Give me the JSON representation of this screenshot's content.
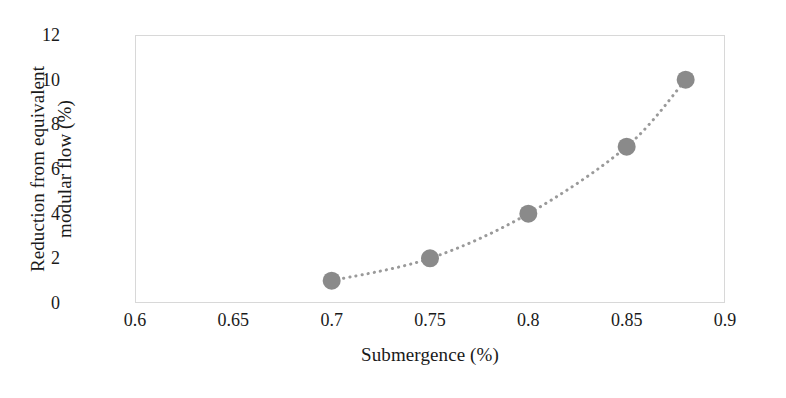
{
  "chart_data": {
    "type": "scatter",
    "title": "",
    "xlabel": "Submergence (%)",
    "ylabel": "Reduction from equivalent modular flow (%)",
    "ylabel_lines": [
      "Reduction from equivalent",
      "modular flow (%)"
    ],
    "x": [
      0.7,
      0.75,
      0.8,
      0.85,
      0.88
    ],
    "values": [
      1,
      2,
      4,
      7,
      10
    ],
    "series": [
      {
        "name": "Reduction from equivalent modular flow",
        "x": [
          0.7,
          0.75,
          0.8,
          0.85,
          0.88
        ],
        "values": [
          1,
          2,
          4,
          7,
          10
        ],
        "marker": "circle",
        "marker_color": "#8a8a8a",
        "line_style": "dotted",
        "line_color": "#9a9a9a"
      }
    ],
    "xlim": [
      0.6,
      0.9
    ],
    "ylim": [
      0,
      12
    ],
    "xticks": [
      0.6,
      0.65,
      0.7,
      0.75,
      0.8,
      0.85,
      0.9
    ],
    "xtick_labels": [
      "0.6",
      "0.65",
      "0.7",
      "0.75",
      "0.8",
      "0.85",
      "0.9"
    ],
    "yticks": [
      0,
      2,
      4,
      6,
      8,
      10,
      12
    ],
    "ytick_labels": [
      "0",
      "2",
      "4",
      "6",
      "8",
      "10",
      "12"
    ],
    "grid": false,
    "legend": null,
    "legend_position": "none",
    "frame_color": "#d8d8d8",
    "background_color": "#ffffff"
  }
}
